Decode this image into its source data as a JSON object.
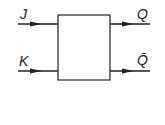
{
  "diagram": {
    "type": "JK flip-flop block",
    "inputs": [
      {
        "label": "J"
      },
      {
        "label": "K"
      }
    ],
    "outputs": [
      {
        "label": "Q"
      },
      {
        "label": "Q̄"
      }
    ],
    "stroke_color": "#222222"
  }
}
